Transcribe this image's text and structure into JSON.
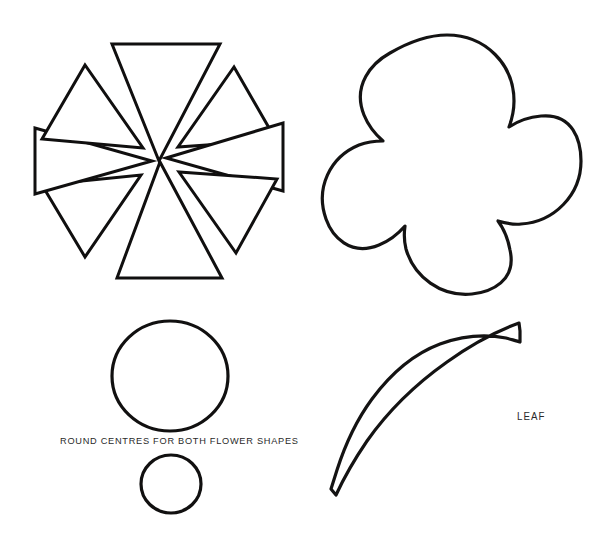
{
  "page": {
    "background_color": "#ffffff",
    "ink_color": "#111010",
    "width": 599,
    "height": 546
  },
  "labels": {
    "round_centres": "ROUND CENTRES FOR BOTH FLOWER SHAPES",
    "leaf": "LEAF"
  },
  "shapes": [
    {
      "id": "star-flower",
      "name": "eight-point-star-flower-template",
      "description": "Eight separate triangular petals radiating from an open centre",
      "petal_count": 8,
      "bounds": {
        "x": 33,
        "y": 36,
        "width": 252,
        "height": 252
      }
    },
    {
      "id": "round-flower",
      "name": "five-petal-flower-template",
      "description": "Five rounded overlapping petals forming a blossom outline",
      "petal_count": 5,
      "bounds": {
        "x": 311,
        "y": 32,
        "width": 272,
        "height": 265
      }
    },
    {
      "id": "large-centre-circle",
      "name": "large-round-centre-template",
      "description": "Large circle used as flower centre",
      "bounds": {
        "x": 111,
        "y": 320,
        "width": 118,
        "height": 112
      }
    },
    {
      "id": "small-centre-circle",
      "name": "small-round-centre-template",
      "description": "Small circle used as flower centre",
      "bounds": {
        "x": 140,
        "y": 454,
        "width": 62,
        "height": 60
      }
    },
    {
      "id": "leaf",
      "name": "leaf-template",
      "description": "Pointed curved leaf with angled cut stem base",
      "bounds": {
        "x": 329,
        "y": 322,
        "width": 193,
        "height": 177
      }
    }
  ]
}
